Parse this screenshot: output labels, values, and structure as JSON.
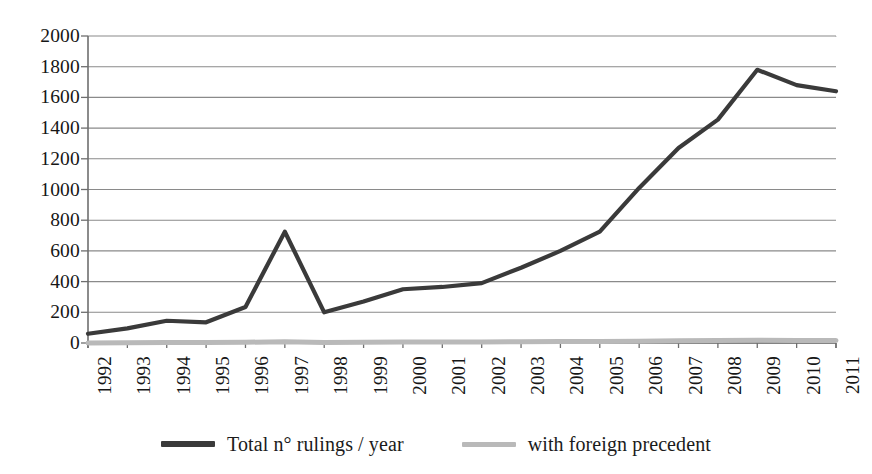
{
  "chart_data": {
    "type": "line",
    "title": "",
    "subtitle": "",
    "xlabel": "",
    "ylabel": "",
    "x": [
      1992,
      1993,
      1994,
      1995,
      1996,
      1997,
      1998,
      1999,
      2000,
      2001,
      2002,
      2003,
      2004,
      2005,
      2006,
      2007,
      2008,
      2009,
      2010,
      2011
    ],
    "categories": [
      "1992",
      "1993",
      "1994",
      "1995",
      "1996",
      "1997",
      "1998",
      "1999",
      "2000",
      "2001",
      "2002",
      "2003",
      "2004",
      "2005",
      "2006",
      "2007",
      "2008",
      "2009",
      "2010",
      "2011"
    ],
    "series": [
      {
        "name": "Total n° rulings / year",
        "color": "#3a3a3a",
        "values": [
          60,
          95,
          145,
          135,
          235,
          725,
          200,
          270,
          350,
          365,
          390,
          490,
          600,
          725,
          1010,
          1270,
          1455,
          1780,
          1680,
          1640
        ]
      },
      {
        "name": "with foreign precedent",
        "color": "#b9b9b9",
        "values": [
          0,
          2,
          3,
          3,
          5,
          8,
          4,
          5,
          6,
          6,
          7,
          8,
          9,
          10,
          12,
          14,
          16,
          18,
          17,
          16
        ]
      }
    ],
    "ylim": [
      0,
      2000
    ],
    "ytick_step": 200,
    "yticks": [
      0,
      200,
      400,
      600,
      800,
      1000,
      1200,
      1400,
      1600,
      1800,
      2000
    ],
    "ytick_labels": [
      "0",
      "200",
      "400",
      "600",
      "800",
      "1000",
      "1200",
      "1400",
      "1600",
      "1800",
      "2000"
    ],
    "grid": true,
    "grid_axis": "y",
    "legend_position": "bottom",
    "xtick_label_rotation": 90
  },
  "legend": {
    "entries": [
      {
        "label": "Total n° rulings / year",
        "swatch": "line-swatch-dark"
      },
      {
        "label": "with foreign precedent",
        "swatch": "line-swatch-gray"
      }
    ]
  },
  "colors": {
    "series_primary": "#3a3a3a",
    "series_secondary": "#b9b9b9",
    "grid": "#8a8a8a",
    "axis": "#6e6e6e",
    "text": "#161616",
    "background": "#ffffff"
  }
}
